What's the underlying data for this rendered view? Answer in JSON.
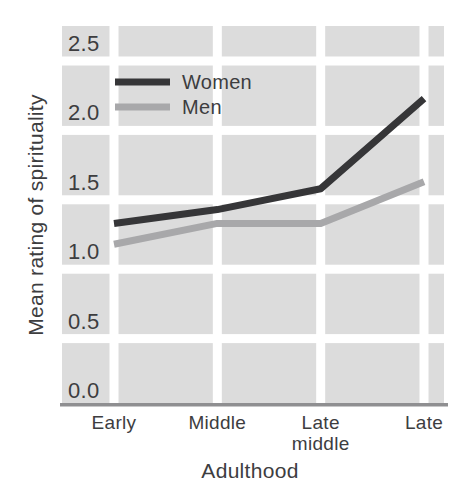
{
  "chart_data": {
    "type": "line",
    "title": "",
    "categories": [
      "Early",
      "Middle",
      "Late middle",
      "Late"
    ],
    "series": [
      {
        "name": "Women",
        "values": [
          1.2,
          1.3,
          1.45,
          2.1
        ],
        "color": "#363638"
      },
      {
        "name": "Men",
        "values": [
          1.05,
          1.2,
          1.2,
          1.5
        ],
        "color": "#a8a8aa"
      }
    ],
    "xlabel": "Adulthood",
    "ylabel": "Mean rating of spirituality",
    "ylim": [
      0,
      2.5
    ],
    "ytick_step": 0.5,
    "ytick_labels": [
      "0.0",
      "0.5",
      "1.0",
      "1.5",
      "2.0",
      "2.5"
    ],
    "grid": "on",
    "legend_position": "top-left",
    "colors": {
      "plot_background": "#dcdcdc",
      "gridline": "#ffffff",
      "axis_line": "#8f8f91",
      "text": "#3d3d3f",
      "page_background": "#ffffff"
    }
  }
}
